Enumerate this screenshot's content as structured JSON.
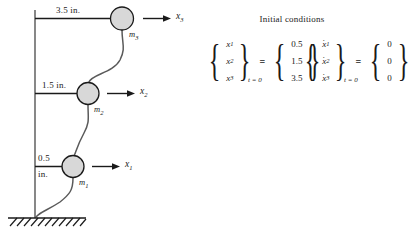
{
  "figure": {
    "masses": [
      {
        "label": "m",
        "index": "1",
        "dimension": "0.5",
        "unit": "in.",
        "coordinate": "x",
        "coord_index": "1"
      },
      {
        "label": "m",
        "index": "2",
        "dimension": "1.5",
        "unit": "in.",
        "coordinate": "x",
        "coord_index": "2"
      },
      {
        "label": "m",
        "index": "3",
        "dimension": "3.5",
        "unit": "in.",
        "coordinate": "x",
        "coord_index": "3"
      }
    ],
    "dimension_labels": {
      "top": "3.5 in.",
      "middle": "1.5 in.",
      "bottom_value": "0.5",
      "bottom_unit": "in."
    },
    "mass_labels": {
      "m1": "m",
      "m2": "m",
      "m3": "m"
    },
    "coordinate_labels": {
      "x1": "x",
      "x2": "x",
      "x3": "x"
    },
    "subscripts": {
      "one": "1",
      "two": "2",
      "three": "3"
    }
  },
  "initial_conditions": {
    "title": "Initial conditions",
    "equals": "=",
    "time_subscript": "t = 0",
    "displacement": {
      "variables": [
        "x",
        "x",
        "x"
      ],
      "var_subscripts": [
        "1",
        "2",
        "3"
      ],
      "values": [
        "0.5",
        "1.5",
        "3.5"
      ]
    },
    "velocity": {
      "variables": [
        "x",
        "x",
        "x"
      ],
      "var_subscripts": [
        "1",
        "2",
        "3"
      ],
      "dot": "·",
      "values": [
        "0",
        "0",
        "0"
      ]
    },
    "braces": {
      "open": "{",
      "close": "}",
      "open_sq": "[",
      "close_sq": "]"
    }
  },
  "colors": {
    "ink": "#1a1a1a",
    "mass_fill": "#d8d8d8",
    "beam": "#555555",
    "ground": "#2a2a2a"
  }
}
